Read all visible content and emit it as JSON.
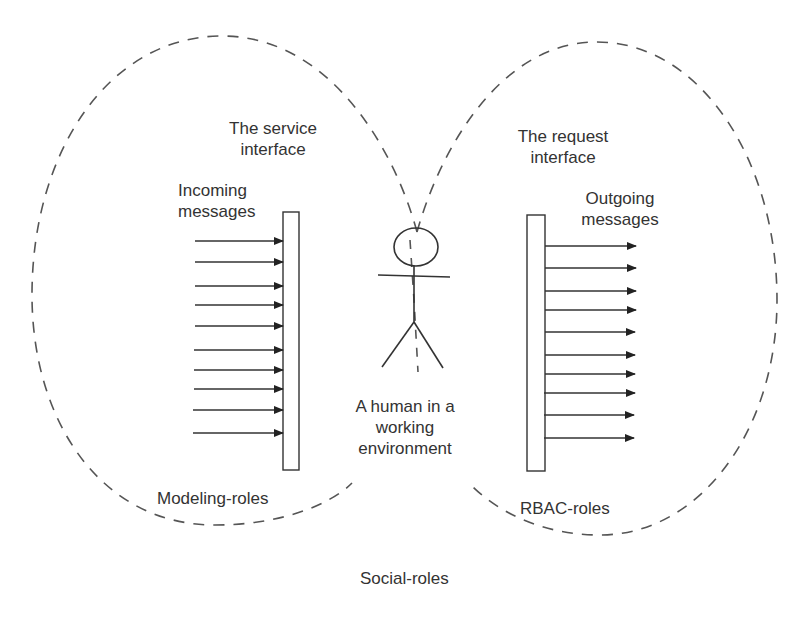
{
  "diagram": {
    "labels": {
      "service_interface_l1": "The service",
      "service_interface_l2": "interface",
      "incoming_l1": "Incoming",
      "incoming_l2": "messages",
      "request_interface_l1": "The request",
      "request_interface_l2": "interface",
      "outgoing_l1": "Outgoing",
      "outgoing_l2": "messages",
      "human_l1": "A human in a",
      "human_l2": "working",
      "human_l3": "environment",
      "modeling_roles": "Modeling-roles",
      "rbac_roles": "RBAC-roles",
      "social_roles": "Social-roles"
    },
    "incoming_arrows_count": 10,
    "outgoing_arrows_count": 10,
    "icons": [
      "stick-figure-human-icon",
      "service-interface-bar",
      "request-interface-bar"
    ],
    "colors": {
      "line": "#333333",
      "dash": "#555555",
      "background": "#ffffff"
    }
  }
}
